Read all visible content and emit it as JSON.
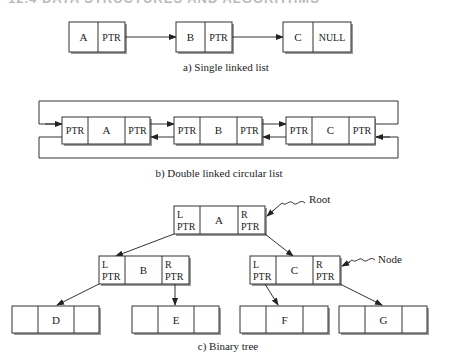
{
  "header": {
    "text": "12.4 DATA STRUCTURES AND ALGORITHMS"
  },
  "single_list": {
    "caption": "a) Single linked list",
    "nodes": [
      {
        "value": "A",
        "pointer": "PTR"
      },
      {
        "value": "B",
        "pointer": "PTR"
      },
      {
        "value": "C",
        "pointer": "NULL"
      }
    ]
  },
  "double_list": {
    "caption": "b) Double linked circular list",
    "nodes": [
      {
        "prev": "PTR",
        "value": "A",
        "next": "PTR"
      },
      {
        "prev": "PTR",
        "value": "B",
        "next": "PTR"
      },
      {
        "prev": "PTR",
        "value": "C",
        "next": "PTR"
      }
    ]
  },
  "binary_tree": {
    "caption": "c) Binary tree",
    "root_label": "Root",
    "node_label": "Node",
    "left_ptr": {
      "l1": "L",
      "l2": "PTR"
    },
    "right_ptr": {
      "l1": "R",
      "l2": "PTR"
    },
    "internal_nodes": [
      {
        "value": "A"
      },
      {
        "value": "B"
      },
      {
        "value": "C"
      }
    ],
    "leaves": [
      {
        "value": "D"
      },
      {
        "value": "E"
      },
      {
        "value": "F"
      },
      {
        "value": "G"
      }
    ]
  }
}
